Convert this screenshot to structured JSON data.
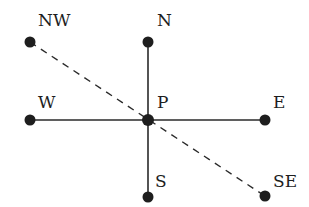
{
  "diagram": {
    "type": "compass-points",
    "center": "P",
    "points": [
      {
        "id": "NW",
        "label": "NW",
        "x": 30,
        "y": 42
      },
      {
        "id": "N",
        "label": "N",
        "x": 148,
        "y": 42
      },
      {
        "id": "W",
        "label": "W",
        "x": 30,
        "y": 120
      },
      {
        "id": "P",
        "label": "P",
        "x": 148,
        "y": 120
      },
      {
        "id": "E",
        "label": "E",
        "x": 265,
        "y": 120
      },
      {
        "id": "S",
        "label": "S",
        "x": 148,
        "y": 197
      },
      {
        "id": "SE",
        "label": "SE",
        "x": 265,
        "y": 196
      }
    ],
    "solid_lines": [
      [
        "N",
        "S"
      ],
      [
        "W",
        "E"
      ]
    ],
    "dashed_lines": [
      [
        "NW",
        "SE"
      ]
    ],
    "colors": {
      "ink": "#1e1e1e",
      "background": "#ffffff"
    }
  }
}
